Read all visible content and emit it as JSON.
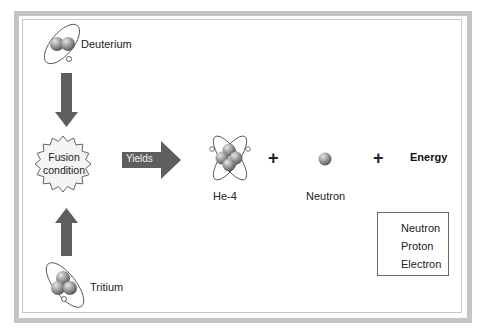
{
  "diagram": {
    "title": "",
    "reactants": [
      {
        "id": "deuterium",
        "label": "Deuterium",
        "nucleons": 2
      },
      {
        "id": "tritium",
        "label": "Tritium",
        "nucleons": 3
      }
    ],
    "condition": {
      "line1": "Fusion",
      "line2": "condition"
    },
    "arrow_label": "Yields",
    "products": [
      {
        "id": "he4",
        "label": "He-4"
      },
      {
        "id": "neutron",
        "label": "Neutron"
      },
      {
        "id": "energy",
        "label": "Energy"
      }
    ],
    "operators": [
      "+",
      "+"
    ],
    "legend": [
      {
        "symbol": "neutron-sphere",
        "label": "Neutron"
      },
      {
        "symbol": "proton-sphere",
        "label": "Proton"
      },
      {
        "symbol": "electron-orbit",
        "label": "Electron"
      }
    ],
    "colors": {
      "arrow": "#5e5e5e",
      "frame": "#c4c4c4",
      "sphere": "#8f8f8f",
      "burst_fill": "#f4f4f4"
    }
  }
}
